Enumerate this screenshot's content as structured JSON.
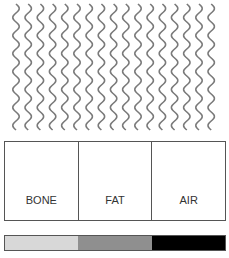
{
  "waves": {
    "count": 17,
    "color": "#7a7a7a"
  },
  "table": {
    "columns": [
      {
        "label": "BONE"
      },
      {
        "label": "FAT"
      },
      {
        "label": "AIR"
      }
    ]
  },
  "bar": {
    "segments": [
      {
        "tissue": "BONE",
        "color": "#d8d8d8"
      },
      {
        "tissue": "FAT",
        "color": "#8f8f8f"
      },
      {
        "tissue": "AIR",
        "color": "#000000"
      }
    ]
  }
}
